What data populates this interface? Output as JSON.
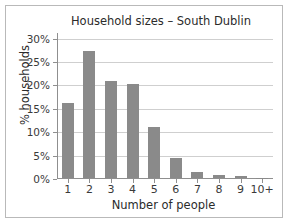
{
  "chart_data": {
    "type": "bar",
    "title": "Household sizes – South Dublin",
    "xlabel": "Number of people",
    "ylabel": "% households",
    "categories": [
      "1",
      "2",
      "3",
      "4",
      "5",
      "6",
      "7",
      "8",
      "9",
      "10+"
    ],
    "values": [
      16.0,
      27.2,
      20.7,
      20.1,
      10.8,
      4.2,
      1.3,
      0.6,
      0.4,
      0.1
    ],
    "series": [
      {
        "name": "% households",
        "values": [
          16.0,
          27.2,
          20.7,
          20.1,
          10.8,
          4.2,
          1.3,
          0.6,
          0.4,
          0.1
        ]
      }
    ],
    "ylim": [
      0,
      31.2
    ],
    "yticks": [
      0,
      5,
      10,
      15,
      20,
      25,
      30
    ],
    "ytick_labels": [
      "0%",
      "5%",
      "10%",
      "15%",
      "20%",
      "25%",
      "30%"
    ],
    "grid": true,
    "grid_axis": "y",
    "legend": false,
    "legend_position": "none",
    "bar_color": "#8a8a8a",
    "grid_color": "#cfcfcf",
    "axis_color": "#8f8f8f",
    "background_color": "#ffffff",
    "frame_color": "#b9b9b9",
    "text_color": "#2b2b2b"
  }
}
